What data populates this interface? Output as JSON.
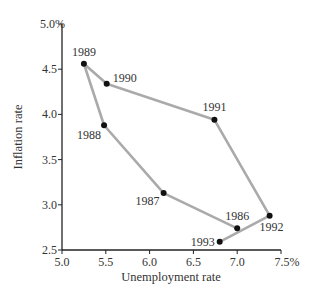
{
  "chart_data": {
    "type": "line",
    "title": "",
    "xlabel": "Unemployment rate",
    "ylabel": "Inflation rate",
    "xlim": [
      5.0,
      7.5
    ],
    "ylim": [
      2.5,
      5.0
    ],
    "x_ticks": [
      "5.0",
      "5.5",
      "6.0",
      "6.5",
      "7.0",
      "7.5%"
    ],
    "y_ticks": [
      "2.5",
      "3.0",
      "3.5",
      "4.0",
      "4.5",
      "5.0%"
    ],
    "grid": false,
    "legend": null,
    "series": [
      {
        "name": "Unemployment vs Inflation 1986-1993",
        "points": [
          {
            "label": "1986",
            "x": 7.0,
            "y": 2.74
          },
          {
            "label": "1987",
            "x": 6.16,
            "y": 3.13
          },
          {
            "label": "1988",
            "x": 5.48,
            "y": 3.88
          },
          {
            "label": "1989",
            "x": 5.25,
            "y": 4.56
          },
          {
            "label": "1990",
            "x": 5.51,
            "y": 4.34
          },
          {
            "label": "1991",
            "x": 6.74,
            "y": 3.94
          },
          {
            "label": "1992",
            "x": 7.37,
            "y": 2.88
          },
          {
            "label": "1993",
            "x": 6.8,
            "y": 2.59
          }
        ]
      }
    ],
    "colors": {
      "line": "#aaaaaa",
      "point": "#111111",
      "axis": "#222222"
    }
  }
}
